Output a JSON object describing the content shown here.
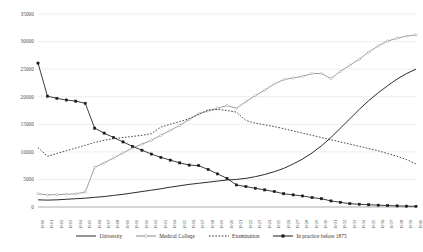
{
  "chart_data": {
    "type": "line",
    "title": "",
    "xlabel": "",
    "ylabel": "",
    "xlim": [
      1900,
      1940
    ],
    "ylim": [
      0,
      35000
    ],
    "ytick_values": [
      0,
      5000,
      10000,
      15000,
      20000,
      25000,
      30000,
      35000
    ],
    "ytick_labels": [
      "0",
      "5000",
      "10000",
      "15000",
      "20000",
      "25000",
      "30000",
      "35000"
    ],
    "grid": "horizontal",
    "legend_position": "bottom",
    "categories": [
      1900,
      1901,
      1902,
      1903,
      1904,
      1905,
      1906,
      1907,
      1908,
      1909,
      1910,
      1911,
      1912,
      1913,
      1914,
      1915,
      1916,
      1917,
      1918,
      1919,
      1920,
      1921,
      1922,
      1923,
      1924,
      1925,
      1926,
      1927,
      1928,
      1929,
      1930,
      1931,
      1932,
      1933,
      1934,
      1935,
      1936,
      1937,
      1938,
      1939,
      1940
    ],
    "category_labels": [
      "1900",
      "1901",
      "1902",
      "1903",
      "1904",
      "1905",
      "1906",
      "1907",
      "1908",
      "1909",
      "1910",
      "1911",
      "1912",
      "1913",
      "1914",
      "1915",
      "1916",
      "1917",
      "1918",
      "1919",
      "1920",
      "1921",
      "1922",
      "1923",
      "1924",
      "1925",
      "1926",
      "1927",
      "1928",
      "1929",
      "1930",
      "1931",
      "1932",
      "1933",
      "1934",
      "1935",
      "1936",
      "1937",
      "1938",
      "1939",
      "1940"
    ],
    "series": [
      {
        "name": "University",
        "color": "#2b2b2b",
        "style": "solid",
        "marker": "none",
        "values": [
          1300,
          1250,
          1300,
          1400,
          1500,
          1600,
          1750,
          1900,
          2100,
          2300,
          2550,
          2800,
          3050,
          3300,
          3600,
          3850,
          4100,
          4300,
          4500,
          4700,
          4900,
          5000,
          5200,
          5500,
          5900,
          6400,
          7000,
          7800,
          8700,
          9800,
          11100,
          12600,
          14300,
          16000,
          17700,
          19300,
          20700,
          22000,
          23200,
          24200,
          25000
        ]
      },
      {
        "name": "Medical College",
        "color": "#8c8c8c",
        "style": "solid",
        "marker": "diamond",
        "values": [
          2400,
          2200,
          2250,
          2300,
          2400,
          2700,
          7200,
          8000,
          8900,
          9800,
          10700,
          11400,
          12100,
          13000,
          13900,
          14800,
          15900,
          16900,
          17400,
          17900,
          18400,
          17900,
          19100,
          20200,
          21200,
          22300,
          23100,
          23400,
          23700,
          24200,
          24200,
          23300,
          24600,
          25700,
          26800,
          28100,
          29200,
          30100,
          30600,
          31000,
          31200
        ]
      },
      {
        "name": "Examination",
        "color": "#2b2b2b",
        "style": "dotted",
        "marker": "none",
        "values": [
          10800,
          9200,
          9700,
          10200,
          10700,
          11200,
          11700,
          12100,
          12400,
          12600,
          12800,
          13000,
          13300,
          14500,
          15000,
          15500,
          16000,
          16800,
          17600,
          17700,
          17500,
          17200,
          15700,
          15200,
          14900,
          14600,
          14200,
          13800,
          13400,
          13000,
          12600,
          12200,
          11800,
          11400,
          11000,
          10600,
          10200,
          9700,
          9200,
          8600,
          7800
        ]
      },
      {
        "name": "In practice before 1875",
        "color": "#1a1a1a",
        "style": "solid",
        "marker": "square",
        "values": [
          26100,
          20100,
          19700,
          19400,
          19200,
          18800,
          14300,
          13400,
          12600,
          11800,
          11000,
          10300,
          9600,
          9000,
          8500,
          8000,
          7600,
          7500,
          6800,
          6000,
          5200,
          4000,
          3700,
          3400,
          3100,
          2800,
          2400,
          2200,
          2000,
          1700,
          1500,
          1100,
          850,
          600,
          500,
          400,
          330,
          260,
          200,
          150,
          120
        ]
      }
    ]
  },
  "legend": {
    "items": [
      {
        "label": "University"
      },
      {
        "label": "Medical College"
      },
      {
        "label": "Examination"
      },
      {
        "label": "In practice before 1875"
      }
    ]
  }
}
